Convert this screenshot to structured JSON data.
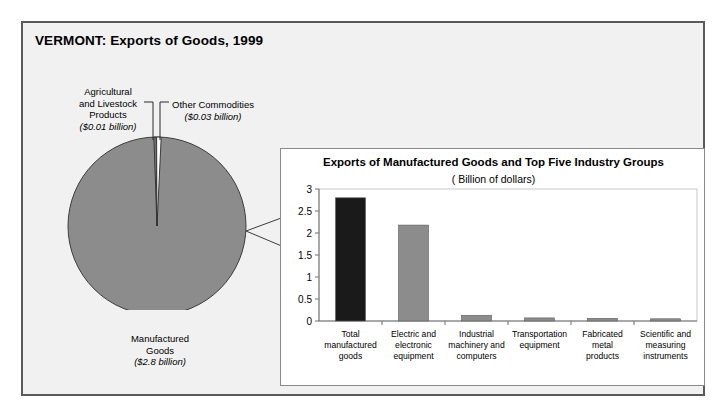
{
  "figure": {
    "title": "VERMONT: Exports of Goods, 1999"
  },
  "pie": {
    "slices": [
      {
        "name": "manufactured-goods",
        "label_line1": "Manufactured",
        "label_line2": "Goods",
        "amount": "($2.8 billion)",
        "value": 2.8,
        "color": "#8c8c8c"
      },
      {
        "name": "agricultural-and-livestock-products",
        "label_line1": "Agricultural",
        "label_line2": "and Livestock",
        "label_line3": "Products",
        "amount": "($0.01 billion)",
        "value": 0.01,
        "color": "#8c8c8c"
      },
      {
        "name": "other-commodities",
        "label_line1": "Other Commodities",
        "amount": "($0.03 billion)",
        "value": 0.03,
        "color": "#8c8c8c"
      }
    ]
  },
  "bar_panel": {
    "title": "Exports of Manufactured Goods and Top Five Industry Groups",
    "subtitle": "( Billion of dollars)"
  },
  "chart_data": {
    "type": "bar",
    "title": "Exports of Manufactured Goods and Top Five Industry Groups",
    "subtitle": "( Billion of dollars)",
    "xlabel": "",
    "ylabel": "",
    "ylim": [
      0,
      3
    ],
    "yticks": [
      "0",
      "0.5",
      "1",
      "1.5",
      "2",
      "2.5",
      "3"
    ],
    "ytick_values": [
      0,
      0.5,
      1,
      1.5,
      2,
      2.5,
      3
    ],
    "grid": false,
    "legend": "none",
    "categories": [
      [
        "Total",
        "manufactured",
        "goods"
      ],
      [
        "Electric and",
        "electronic",
        "equipment"
      ],
      [
        "Industrial",
        "machinery and",
        "computers"
      ],
      [
        "Transportation",
        "equipment"
      ],
      [
        "Fabricated",
        "metal",
        "products"
      ],
      [
        "Scientific and",
        "measuring",
        "instruments"
      ]
    ],
    "values": [
      2.8,
      2.18,
      0.13,
      0.07,
      0.06,
      0.05
    ],
    "bar_colors": [
      "#1a1a1a",
      "#8c8c8c",
      "#8c8c8c",
      "#8c8c8c",
      "#8c8c8c",
      "#8c8c8c"
    ]
  },
  "colors": {
    "frame_border": "#5a5a5a",
    "frame_background": "#f1f1f1",
    "panel_background": "#ffffff",
    "pie_fill": "#8c8c8c",
    "highlight_bar": "#1a1a1a",
    "bar_fill": "#8c8c8c",
    "axis": "#6e6e6e"
  }
}
